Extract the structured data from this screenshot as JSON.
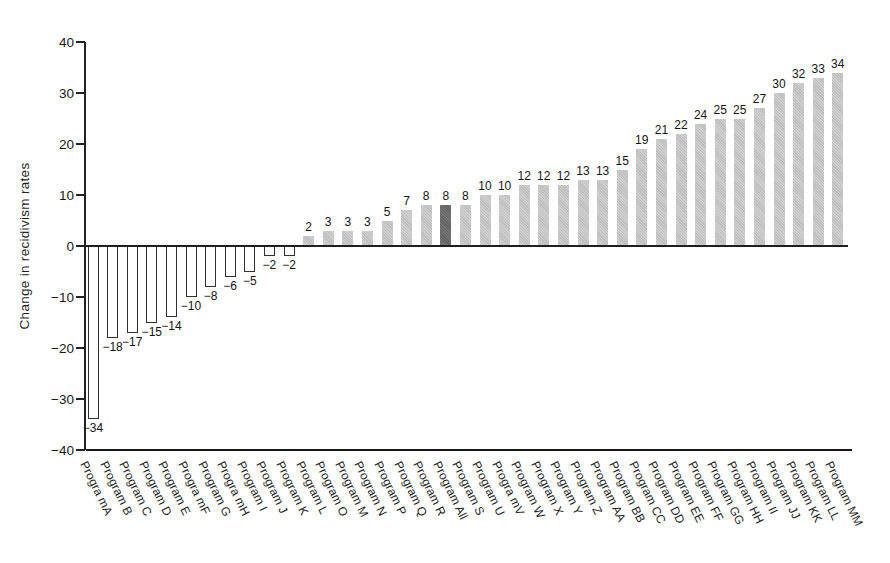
{
  "chart_data": {
    "type": "bar",
    "title": "",
    "xlabel": "",
    "ylabel": "Change in recidivism rates",
    "ylim": [
      -40,
      40
    ],
    "yticks": [
      40,
      30,
      20,
      10,
      0,
      -10,
      -20,
      -30,
      -40
    ],
    "grid": false,
    "legend": false,
    "value_labels": "outside bar ends",
    "categories": [
      "Progra mA",
      "Program B",
      "Program C",
      "Program D",
      "Program E",
      "Progra mF",
      "Program G",
      "Progra mH",
      "Program I",
      "Program J",
      "Program K",
      "Program L",
      "Program O",
      "Program M",
      "Program N",
      "Program P",
      "Program Q",
      "Program R",
      "Program All",
      "Program S",
      "Program U",
      "Progra mV",
      "Program W",
      "Program X",
      "Program Y",
      "Program Z",
      "Program AA",
      "Program BB",
      "Program CC",
      "Program DD",
      "Program EE",
      "Program FF",
      "Program GG",
      "Program HH",
      "Program II",
      "Program JJ",
      "Program KK",
      "Program LL",
      "Program MM"
    ],
    "values": [
      -34,
      -18,
      -17,
      -15,
      -14,
      -10,
      -8,
      -6,
      -5,
      -2,
      -2,
      2,
      3,
      3,
      3,
      5,
      7,
      8,
      8,
      8,
      10,
      10,
      12,
      12,
      12,
      13,
      13,
      15,
      19,
      21,
      22,
      24,
      25,
      25,
      27,
      30,
      32,
      33,
      34
    ],
    "highlight_index": 18,
    "highlight_category": "Program All",
    "bar_style_rule": {
      "negative_bars": "white fill with dark outline",
      "positive_bars": "light gray fill",
      "highlight_bar": "dark gray fill"
    },
    "colors": {
      "bar_light_gray": "#c5c6c5",
      "bar_dark_gray": "#696969",
      "bar_outline": "#2f2f2f",
      "axis": "#222222",
      "text": "#1a1a1a",
      "background": "#ffffff"
    }
  }
}
